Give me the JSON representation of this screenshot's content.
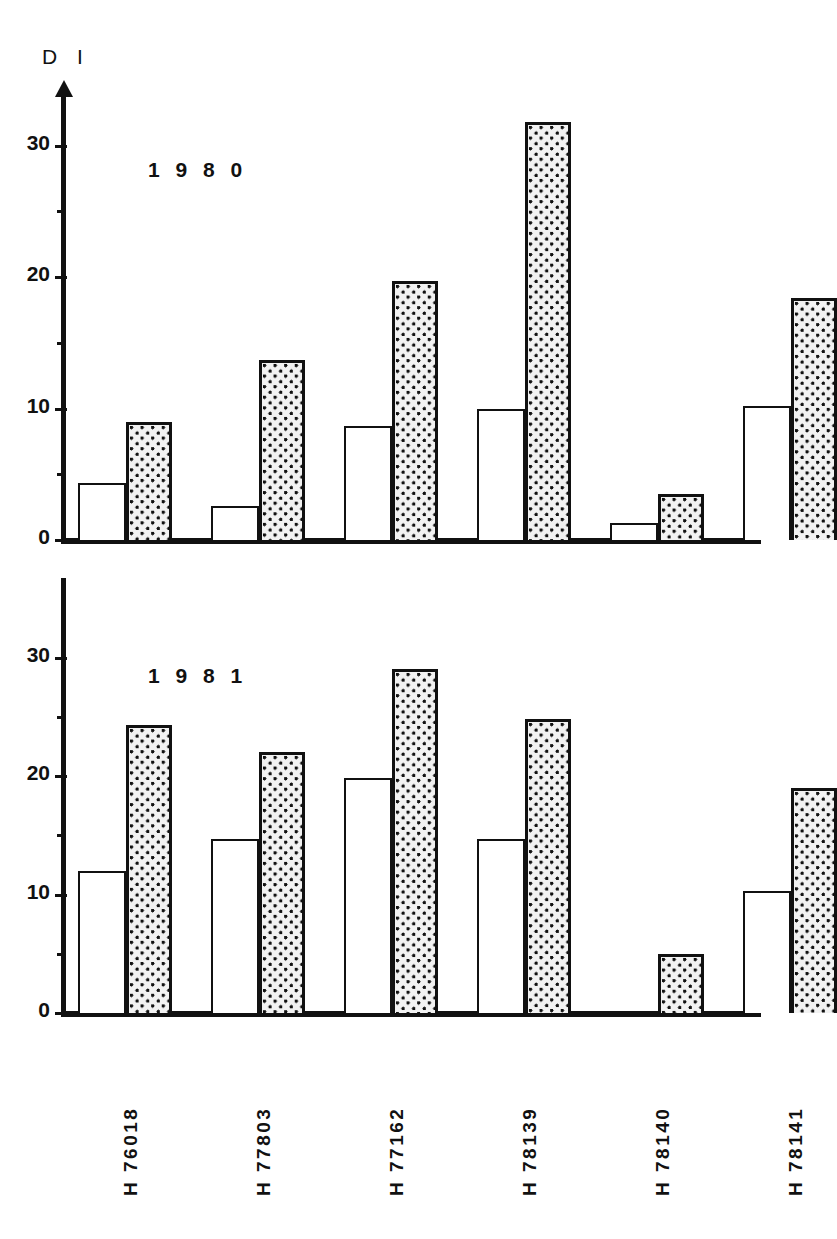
{
  "figure": {
    "yaxis_title": "D I",
    "categories": [
      "H 76018",
      "H 77803",
      "H 77162",
      "H 78139",
      "H 78140",
      "H 78141"
    ],
    "panels": [
      {
        "year_label": "1 9 8 0"
      },
      {
        "year_label": "1 9 8 1"
      }
    ],
    "y_tick_labels": [
      "0",
      "10",
      "20",
      "30"
    ],
    "colors": {
      "ink": "#111111",
      "open_bar_fill": "#ffffff",
      "shaded_bar_fill": "#f2f2f2"
    }
  },
  "chart_data": [
    {
      "type": "bar",
      "title": "1980",
      "xlabel": "",
      "ylabel": "D I",
      "ylim": [
        0,
        34
      ],
      "yticks": [
        0,
        10,
        20,
        30
      ],
      "yticks_minor": [
        5,
        15,
        25
      ],
      "grid": false,
      "legend": "none",
      "categories": [
        "H 76018",
        "H 77803",
        "H 77162",
        "H 78139",
        "H 78140",
        "H 78141"
      ],
      "series": [
        {
          "name": "open",
          "style": "white-outline",
          "values": [
            4.3,
            2.6,
            8.7,
            10.0,
            1.3,
            10.2
          ]
        },
        {
          "name": "shaded",
          "style": "stippled",
          "values": [
            9.0,
            13.7,
            19.7,
            31.8,
            3.5,
            18.4
          ]
        }
      ]
    },
    {
      "type": "bar",
      "title": "1981",
      "xlabel": "",
      "ylabel": "D I",
      "ylim": [
        0,
        34
      ],
      "yticks": [
        0,
        10,
        20,
        30
      ],
      "yticks_minor": [
        5,
        15,
        25
      ],
      "grid": false,
      "legend": "none",
      "categories": [
        "H 76018",
        "H 77803",
        "H 77162",
        "H 78139",
        "H 78140",
        "H 78141"
      ],
      "series": [
        {
          "name": "open",
          "style": "white-outline",
          "values": [
            12.0,
            14.7,
            19.8,
            14.7,
            0.0,
            10.3
          ]
        },
        {
          "name": "shaded",
          "style": "stippled",
          "values": [
            24.3,
            22.0,
            29.0,
            24.8,
            5.0,
            19.0
          ]
        }
      ]
    }
  ]
}
